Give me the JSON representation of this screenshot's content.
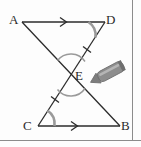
{
  "figure": {
    "kind": "geometry-diagram",
    "background_color": "#fdfdfd",
    "stroke_color": "#2b2b2b",
    "border_color": "#8c8c8c",
    "arc_color": "#8f8f8f",
    "pencil_color": "#8a8a8a",
    "pencil_tip_color": "#6f6f6f"
  },
  "labels": {
    "a": "A",
    "d": "D",
    "e": "E",
    "c": "C",
    "b": "B"
  },
  "points": {
    "a": {
      "x": 22,
      "y": 22
    },
    "d": {
      "x": 105,
      "y": 22
    },
    "c": {
      "x": 38,
      "y": 126
    },
    "b": {
      "x": 120,
      "y": 126
    },
    "e": {
      "x": 71,
      "y": 75
    }
  },
  "segments": [
    {
      "name": "AD",
      "from": "a",
      "to": "d",
      "marks": "single-arrow"
    },
    {
      "name": "CB",
      "from": "c",
      "to": "b",
      "marks": "single-arrow"
    },
    {
      "name": "AB",
      "from": "a",
      "to": "b",
      "marks": "none"
    },
    {
      "name": "DC",
      "from": "d",
      "to": "c",
      "marks": "single-tick-each-half"
    }
  ],
  "marks": {
    "arrow_on_ad": "single arrow pointing right",
    "arrow_on_cb": "single arrow pointing right",
    "tick_on_de": "single tick",
    "tick_on_ec": "single tick",
    "angle_arc_at_d": "arc between DA and DC",
    "angle_arc_at_c": "arc between CD and CB",
    "angle_arc_at_e_upper": "vertical angle arc above E",
    "angle_arc_at_e_lower": "vertical angle arc below E"
  },
  "pencil": {
    "present": true,
    "points_to": "E",
    "angle_deg": -28
  }
}
